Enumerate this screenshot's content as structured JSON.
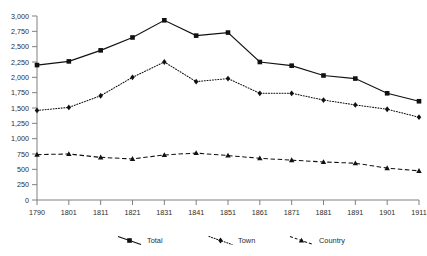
{
  "chart_data": {
    "type": "line",
    "title": "",
    "subtitle": "",
    "xlabel": "",
    "ylabel": "",
    "categories": [
      "1790",
      "1801",
      "1811",
      "1821",
      "1831",
      "1841",
      "1851",
      "1861",
      "1871",
      "1881",
      "1891",
      "1901",
      "1911"
    ],
    "x": [
      1790,
      1801,
      1811,
      1821,
      1831,
      1841,
      1851,
      1861,
      1871,
      1881,
      1891,
      1901,
      1911
    ],
    "series": [
      {
        "name": "Total",
        "marker": "square",
        "line_style": "solid",
        "color": "#111111",
        "values": [
          2200,
          2260,
          2440,
          2650,
          2930,
          2680,
          2730,
          2250,
          2190,
          2030,
          1980,
          1740,
          1610
        ]
      },
      {
        "name": "Town",
        "marker": "diamond",
        "line_style": "dotted",
        "color": "#111111",
        "values": [
          1460,
          1510,
          1700,
          2000,
          2250,
          1930,
          1980,
          1740,
          1740,
          1630,
          1550,
          1480,
          1350
        ]
      },
      {
        "name": "Country",
        "marker": "triangle",
        "line_style": "dashed",
        "color": "#111111",
        "values": [
          740,
          750,
          695,
          670,
          735,
          765,
          725,
          680,
          650,
          620,
          600,
          520,
          475
        ]
      }
    ],
    "ylim": [
      0,
      3000
    ],
    "yticks": [
      0,
      250,
      500,
      750,
      1000,
      1250,
      1500,
      1750,
      2000,
      2250,
      2500,
      2750,
      3000
    ],
    "ytick_labels": [
      "0",
      "250",
      "500",
      "750",
      "1,000",
      "1,250",
      "1,500",
      "1,750",
      "2,000",
      "2,250",
      "2,500",
      "2,750",
      "3,000"
    ],
    "grid": false,
    "legend_position": "bottom",
    "legend_entries": [
      "Total",
      "Town",
      "Country"
    ],
    "annotations": []
  },
  "legend": {
    "total_label": "Total",
    "town_label": "Town",
    "country_label": "Country"
  }
}
